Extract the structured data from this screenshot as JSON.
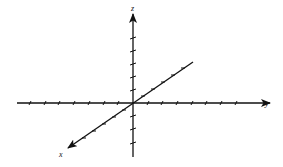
{
  "diagram": {
    "type": "3d-coordinate-axes",
    "origin": [
      133,
      103
    ],
    "stroke_color": "#111111",
    "background": "#ffffff",
    "axes": {
      "x": {
        "label": "x",
        "direction": "diagonal, toward viewer (lower-left)",
        "positive_ticks": 5,
        "negative_ticks": 6
      },
      "y": {
        "label": "y",
        "direction": "horizontal, right",
        "positive_ticks": 7,
        "negative_ticks": 7
      },
      "z": {
        "label": "z",
        "direction": "vertical, up",
        "positive_ticks": 5,
        "negative_ticks": 3
      }
    }
  }
}
